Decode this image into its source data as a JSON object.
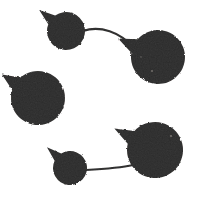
{
  "canvas": {
    "width": 202,
    "height": 200,
    "background_color": "#ffffff",
    "ink_color": "#2b2a29",
    "ink_color_light": "#3a3836",
    "description": "Scanned black-and-white figure of five dark rounded blobs, each with a small pointed tail, joined by two thin curved lines"
  },
  "chart_data": {
    "type": "scatter",
    "title": "",
    "xlabel": "",
    "ylabel": "",
    "xlim": [
      0,
      202
    ],
    "ylim": [
      0,
      200
    ],
    "grid": false,
    "legend": "none",
    "nodes": [
      {
        "id": "node-top-left",
        "label": "top-left blob",
        "cx": 66,
        "cy": 31,
        "r": 19,
        "tail_angle_deg": 218,
        "tail_length": 15,
        "tail_width_deg": 17,
        "fill": "#2b2a29"
      },
      {
        "id": "node-top-right",
        "label": "top-right blob",
        "cx": 158,
        "cy": 57,
        "r": 27,
        "tail_angle_deg": 205,
        "tail_length": 17,
        "tail_width_deg": 16,
        "fill": "#2b2a29"
      },
      {
        "id": "node-left-middle",
        "label": "left-middle blob",
        "cx": 38,
        "cy": 98,
        "r": 27,
        "tail_angle_deg": 213,
        "tail_length": 16,
        "tail_width_deg": 16,
        "fill": "#2b2a29"
      },
      {
        "id": "node-bottom-right",
        "label": "bottom-right blob",
        "cx": 155,
        "cy": 150,
        "r": 28,
        "tail_angle_deg": 208,
        "tail_length": 18,
        "tail_width_deg": 15,
        "fill": "#2b2a29"
      },
      {
        "id": "node-bottom-left",
        "label": "bottom-small blob",
        "cx": 70,
        "cy": 168,
        "r": 17,
        "tail_angle_deg": 222,
        "tail_length": 14,
        "tail_width_deg": 17,
        "fill": "#2b2a29"
      }
    ],
    "edges": [
      {
        "id": "edge-top",
        "from": "node-top-left",
        "to": "node-top-right",
        "path": "M 83 31 C 100 25, 120 32, 134 48",
        "stroke": "#2b2a29",
        "stroke_width": 2.1
      },
      {
        "id": "edge-bottom",
        "from": "node-bottom-left",
        "to": "node-bottom-right",
        "path": "M 86 170 C 104 169, 120 168, 133 165",
        "stroke": "#2b2a29",
        "stroke_width": 2.1
      }
    ],
    "speck_marks": [
      {
        "cx": 152,
        "cy": 71,
        "r": 1.0
      },
      {
        "cx": 171,
        "cy": 136,
        "r": 1.1
      },
      {
        "cx": 141,
        "cy": 57,
        "r": 0.7
      }
    ]
  },
  "alt_text": "Five dark irregular circular blobs with small pointed tails arranged in a C shape, two pairs joined by thin curved lines"
}
